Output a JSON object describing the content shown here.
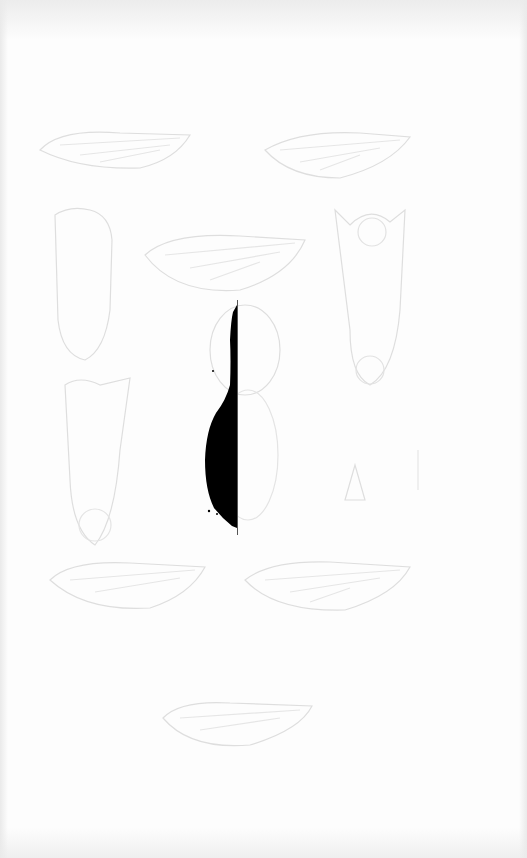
{
  "image": {
    "description": "Scanned natural history plate showing faint engravings of insect wings and bodies, with a black silhouette artifact in the center",
    "background_color": "#fdfdfd",
    "sketch_color": "#dcdcdc",
    "silhouette_color": "#000000"
  },
  "figures": [
    {
      "name": "wing-top-left"
    },
    {
      "name": "wing-top-right"
    },
    {
      "name": "body-left"
    },
    {
      "name": "wing-center"
    },
    {
      "name": "body-right"
    },
    {
      "name": "head-center"
    },
    {
      "name": "body-lower-left"
    },
    {
      "name": "body-lower-right"
    },
    {
      "name": "wing-lower-left"
    },
    {
      "name": "wing-lower-right"
    },
    {
      "name": "wing-bottom"
    }
  ]
}
